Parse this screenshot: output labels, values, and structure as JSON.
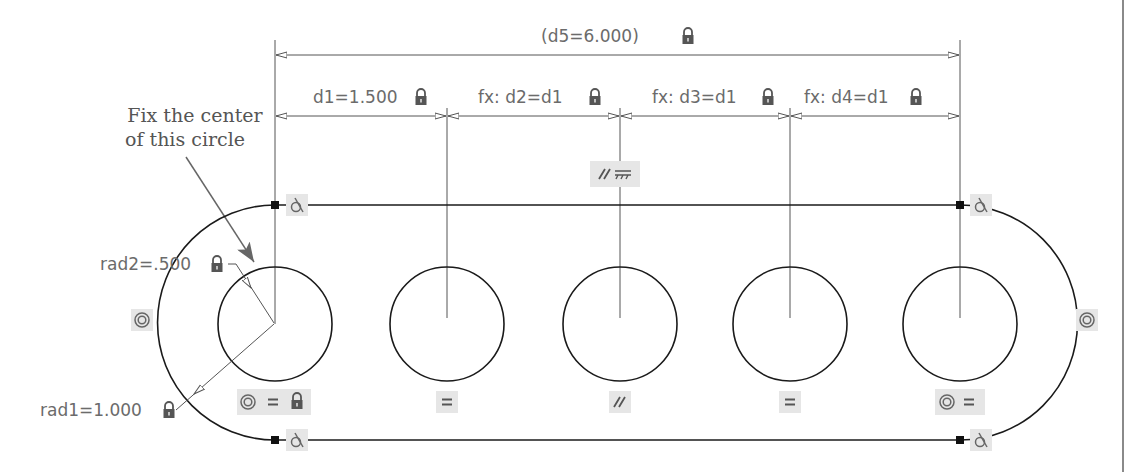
{
  "annotation": {
    "line1": "Fix the center",
    "line2": "of this circle"
  },
  "dimensions": {
    "overall": "(d5=6.000)",
    "d1": "d1=1.500",
    "d2": "fx: d2=d1",
    "d3": "fx: d3=d1",
    "d4": "fx: d4=d1",
    "rad2": "rad2=.500",
    "rad1": "rad1=1.000"
  },
  "constraints": {
    "horizontal_mid": [
      "parallel-icon",
      "horizontal-icon"
    ],
    "circle1": [
      "concentric-icon",
      "equal-icon",
      "fix-icon"
    ],
    "circle2": [
      "equal-icon"
    ],
    "circle3": [
      "parallel-icon"
    ],
    "circle4": [
      "equal-icon"
    ],
    "circle5": [
      "concentric-icon",
      "equal-icon"
    ],
    "left_arc": [
      "concentric-icon"
    ],
    "right_arc": [
      "concentric-icon"
    ],
    "tangent": [
      "tangent-icon",
      "tangent-icon",
      "tangent-icon",
      "tangent-icon"
    ],
    "equal_symbol": "=",
    "parallel_symbol": "//"
  },
  "colors": {
    "geometry": "#1a1a1a",
    "dimension": "#6b6b6b",
    "badge": "#e6e6e6"
  }
}
